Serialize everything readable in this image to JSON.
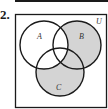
{
  "question": {
    "number": "2."
  },
  "diagram": {
    "universe_label": "U",
    "sets": [
      {
        "label": "A",
        "cx": 44,
        "cy": 45,
        "r": 24
      },
      {
        "label": "B",
        "cx": 77,
        "cy": 45,
        "r": 24
      },
      {
        "label": "C",
        "cx": 60,
        "cy": 72,
        "r": 24
      }
    ],
    "shaded_region": "(B ∪ C) ∩ A'",
    "shade_color": "#d4d4d4",
    "line_color": "#1a1a1a"
  }
}
